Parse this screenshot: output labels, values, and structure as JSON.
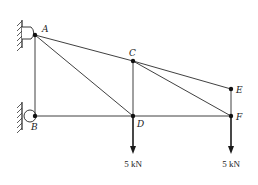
{
  "diagram": {
    "type": "truss",
    "nodes": [
      {
        "id": "A",
        "x": 35,
        "y": 35,
        "label": "A"
      },
      {
        "id": "B",
        "x": 35,
        "y": 116,
        "label": "B"
      },
      {
        "id": "C",
        "x": 133,
        "y": 61,
        "label": "C"
      },
      {
        "id": "D",
        "x": 133,
        "y": 116,
        "label": "D"
      },
      {
        "id": "E",
        "x": 231,
        "y": 89,
        "label": "E"
      },
      {
        "id": "F",
        "x": 231,
        "y": 116,
        "label": "F"
      }
    ],
    "members": [
      [
        "A",
        "C"
      ],
      [
        "C",
        "E"
      ],
      [
        "A",
        "B"
      ],
      [
        "A",
        "D"
      ],
      [
        "B",
        "D"
      ],
      [
        "D",
        "F"
      ],
      [
        "C",
        "D"
      ],
      [
        "C",
        "F"
      ],
      [
        "E",
        "F"
      ]
    ],
    "supports": [
      {
        "node": "A",
        "type": "pin-wall"
      },
      {
        "node": "B",
        "type": "pin-wall"
      }
    ],
    "loads": [
      {
        "node": "D",
        "magnitude": "5 kN",
        "direction": "down"
      },
      {
        "node": "F",
        "magnitude": "5 kN",
        "direction": "down"
      }
    ]
  },
  "labels": {
    "node_a": "A",
    "node_b": "B",
    "node_c": "C",
    "node_d": "D",
    "node_e": "E",
    "node_f": "F",
    "load_d": "5 kN",
    "load_f": "5 kN"
  }
}
